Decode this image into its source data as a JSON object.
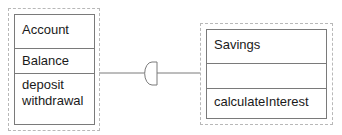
{
  "diagram": {
    "classes": [
      {
        "name": "Account",
        "attributes": [
          "Balance"
        ],
        "operations": [
          "deposit",
          "withdrawal"
        ]
      },
      {
        "name": "Savings",
        "attributes": [],
        "operations": [
          "calculateInterest"
        ]
      }
    ],
    "connector": {
      "from": "Account",
      "to": "Savings",
      "symbol": "half-circle (socket)"
    }
  }
}
